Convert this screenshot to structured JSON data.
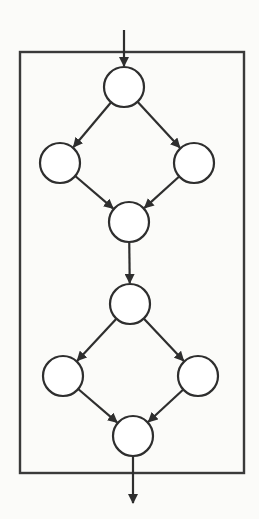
{
  "diagram": {
    "type": "control-flow-graph",
    "colors": {
      "stroke": "#2e2e2e",
      "node_fill": "#ffffff",
      "background": "#fbfbf9"
    },
    "frame": {
      "x1": 20,
      "y1": 52,
      "x2": 244,
      "y2": 473
    },
    "node_radius": 20,
    "nodes": [
      {
        "id": "n1",
        "cx": 124,
        "cy": 87,
        "label": ""
      },
      {
        "id": "n2",
        "cx": 60,
        "cy": 163,
        "label": ""
      },
      {
        "id": "n3",
        "cx": 194,
        "cy": 163,
        "label": ""
      },
      {
        "id": "n4",
        "cx": 129,
        "cy": 222,
        "label": ""
      },
      {
        "id": "n5",
        "cx": 130,
        "cy": 304,
        "label": ""
      },
      {
        "id": "n6",
        "cx": 63,
        "cy": 376,
        "label": ""
      },
      {
        "id": "n7",
        "cx": 198,
        "cy": 376,
        "label": ""
      },
      {
        "id": "n8",
        "cx": 133,
        "cy": 436,
        "label": ""
      }
    ],
    "edges": [
      {
        "from": "entry",
        "to": "n1"
      },
      {
        "from": "n1",
        "to": "n2"
      },
      {
        "from": "n1",
        "to": "n3"
      },
      {
        "from": "n2",
        "to": "n4"
      },
      {
        "from": "n3",
        "to": "n4"
      },
      {
        "from": "n4",
        "to": "n5"
      },
      {
        "from": "n5",
        "to": "n6"
      },
      {
        "from": "n5",
        "to": "n7"
      },
      {
        "from": "n6",
        "to": "n8"
      },
      {
        "from": "n7",
        "to": "n8"
      },
      {
        "from": "n8",
        "to": "exit"
      }
    ],
    "entry": {
      "x": 124,
      "y": 30
    },
    "exit": {
      "x": 133,
      "y": 503
    }
  }
}
